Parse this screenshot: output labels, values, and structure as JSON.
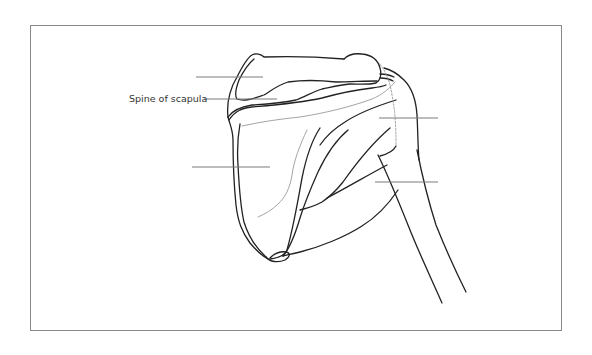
{
  "figure": {
    "labels": [
      {
        "id": "label-1",
        "text": "",
        "line": {
          "x1": 196,
          "y1": 77,
          "x2": 263,
          "y2": 77
        }
      },
      {
        "id": "label-spine",
        "text": "Spine of scapula",
        "text_pos": {
          "x": 129,
          "y": 93
        },
        "line": {
          "x1": 204,
          "y1": 99,
          "x2": 277,
          "y2": 99
        }
      },
      {
        "id": "label-3",
        "text": "",
        "line": {
          "x1": 192,
          "y1": 167,
          "x2": 270,
          "y2": 167
        }
      },
      {
        "id": "label-4",
        "text": "",
        "line": {
          "x1": 379,
          "y1": 118,
          "x2": 438,
          "y2": 118
        }
      },
      {
        "id": "label-5",
        "text": "",
        "line": {
          "x1": 375,
          "y1": 182,
          "x2": 438,
          "y2": 182
        }
      }
    ],
    "colors": {
      "outline": "#222222",
      "faint_line": "#9a9a9a",
      "label_line": "#7a7a7a",
      "frame": "#8a8a8a",
      "text": "#333333"
    }
  }
}
